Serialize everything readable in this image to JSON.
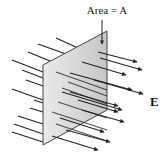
{
  "diagram": {
    "type": "electric-flux-through-plane",
    "labels": {
      "area": "Area = A",
      "field": "E"
    },
    "colors": {
      "plane_fill": "#d4d4d4",
      "plane_edge": "#444444",
      "field_lines": "#222222",
      "background": "#ffffff"
    },
    "plane": {
      "corners": [
        [
          107,
          31
        ],
        [
          43,
          65
        ],
        [
          43,
          145
        ],
        [
          107,
          110
        ]
      ]
    }
  }
}
